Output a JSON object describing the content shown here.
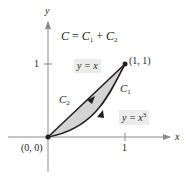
{
  "figure": {
    "equation": {
      "lhs": "C",
      "eq": " = ",
      "c1": "C",
      "c1_sub": "1",
      "plus": " + ",
      "c2": "C",
      "c2_sub": "2"
    },
    "axes": {
      "x_label": "x",
      "y_label": "y",
      "x_tick_label": "1",
      "y_tick_label": "1"
    },
    "points": {
      "origin": "(0, 0)",
      "end": "(1, 1)"
    },
    "curves": {
      "c1_label": "C",
      "c1_sub": "1",
      "c2_label": "C",
      "c2_sub": "2",
      "line_label": "y = x",
      "cubic_label_base": "y = x",
      "cubic_label_exp": "3"
    },
    "colors": {
      "stroke": "#231f20",
      "region_fill": "#d4d4d4",
      "label_bg": "#ececec"
    }
  }
}
